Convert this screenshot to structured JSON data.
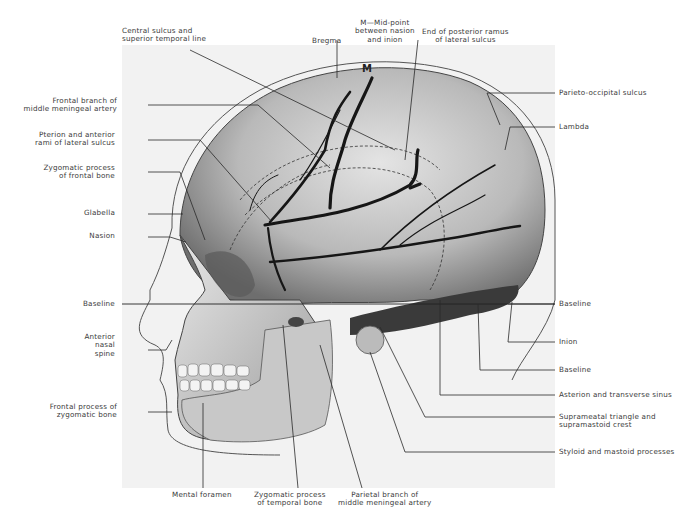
{
  "figure": {
    "marker_M": "M",
    "labels_top": [
      {
        "id": "central-sulcus",
        "lines": [
          "Central sulcus and",
          "superior temporal line"
        ]
      },
      {
        "id": "bregma",
        "lines": [
          "Bregma"
        ]
      },
      {
        "id": "midpoint-m",
        "lines": [
          "M—Mid-point",
          "between nasion",
          "and inion"
        ]
      },
      {
        "id": "posterior-ramus-end",
        "lines": [
          "End of posterior ramus",
          "of lateral sulcus"
        ]
      }
    ],
    "labels_left": [
      {
        "id": "frontal-branch-mma",
        "lines": [
          "Frontal branch of",
          "middle meningeal artery"
        ]
      },
      {
        "id": "pterion",
        "lines": [
          "Pterion and anterior",
          "rami of lateral sulcus"
        ]
      },
      {
        "id": "zygomatic-process-frontal",
        "lines": [
          "Zygomatic process",
          "of frontal bone"
        ]
      },
      {
        "id": "glabella",
        "lines": [
          "Glabella"
        ]
      },
      {
        "id": "nasion",
        "lines": [
          "Nasion"
        ]
      },
      {
        "id": "baseline-left",
        "lines": [
          "Baseline"
        ]
      },
      {
        "id": "anterior-nasal-spine",
        "lines": [
          "Anterior",
          "nasal",
          "spine"
        ]
      },
      {
        "id": "frontal-process-zygomatic",
        "lines": [
          "Frontal process of",
          "zygomatic bone"
        ]
      }
    ],
    "labels_right": [
      {
        "id": "parieto-occipital-sulcus",
        "lines": [
          "Parieto-occipital sulcus"
        ]
      },
      {
        "id": "lambda",
        "lines": [
          "Lambda"
        ]
      },
      {
        "id": "baseline-right-1",
        "lines": [
          "Baseline"
        ]
      },
      {
        "id": "inion",
        "lines": [
          "Inion"
        ]
      },
      {
        "id": "baseline-right-2",
        "lines": [
          "Baseline"
        ]
      },
      {
        "id": "asterion",
        "lines": [
          "Asterion and transverse sinus"
        ]
      },
      {
        "id": "suprameatal",
        "lines": [
          "Suprameatal triangle  and",
          "supramastoid crest"
        ]
      },
      {
        "id": "styloid-mastoid",
        "lines": [
          "Styloid and mastoid processes"
        ]
      }
    ],
    "labels_bottom": [
      {
        "id": "mental-foramen",
        "lines": [
          "Mental foramen"
        ]
      },
      {
        "id": "zygomatic-process-temporal",
        "lines": [
          "Zygomatic process",
          "of temporal bone"
        ]
      },
      {
        "id": "parietal-branch-mma",
        "lines": [
          "Parietal branch of",
          "middle meningeal artery"
        ]
      }
    ]
  }
}
